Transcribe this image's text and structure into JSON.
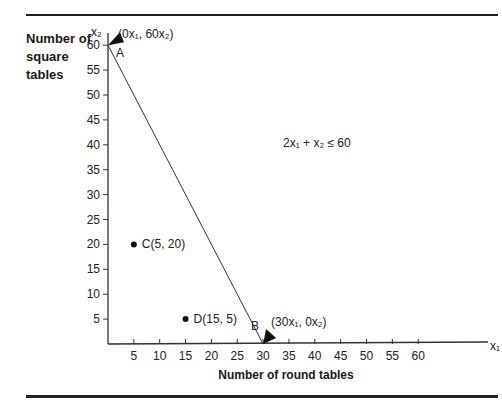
{
  "chart_data": {
    "type": "line",
    "title": "",
    "xlabel": "Number of round tables",
    "ylabel": "Number of square tables",
    "x_axis_symbol": "x1",
    "y_axis_symbol": "x2",
    "xlim": [
      0,
      65
    ],
    "ylim": [
      0,
      62
    ],
    "x_ticks": [
      5,
      10,
      15,
      20,
      25,
      30,
      35,
      40,
      45,
      50,
      55,
      60
    ],
    "y_ticks": [
      5,
      10,
      15,
      20,
      25,
      30,
      35,
      40,
      45,
      50,
      55,
      60
    ],
    "grid": false,
    "series": [
      {
        "name": "Constraint 2x1 + x2 <= 60",
        "x": [
          0,
          30
        ],
        "y": [
          60,
          0
        ]
      }
    ],
    "points": [
      {
        "label": "A",
        "x": 0,
        "y": 60,
        "annotation": "(0x1, 60x2)",
        "marker": "arrow"
      },
      {
        "label": "B",
        "x": 30,
        "y": 0,
        "annotation": "(30x1, 0x2)",
        "marker": "arrow"
      },
      {
        "label": "C(5, 20)",
        "x": 5,
        "y": 20,
        "marker": "dot"
      },
      {
        "label": "D(15, 5)",
        "x": 15,
        "y": 5,
        "marker": "dot"
      }
    ],
    "annotations": [
      "2x1 + x2 ≤ 60"
    ]
  },
  "labels": {
    "ylabel_line1": "Number of",
    "ylabel_line2": "square",
    "ylabel_line3": "tables",
    "xlabel": "Number of round tables",
    "constraint": "2x₁ + x₂ ≤ 60",
    "x_axis_symbol": "x₁",
    "y_axis_symbol": "x₂",
    "point_a": "A",
    "point_a_coord": "(0x₁, 60x₂)",
    "point_b": "B",
    "point_b_coord": "(30x₁, 0x₂)",
    "point_c": "C(5, 20)",
    "point_d": "D(15, 5)"
  }
}
